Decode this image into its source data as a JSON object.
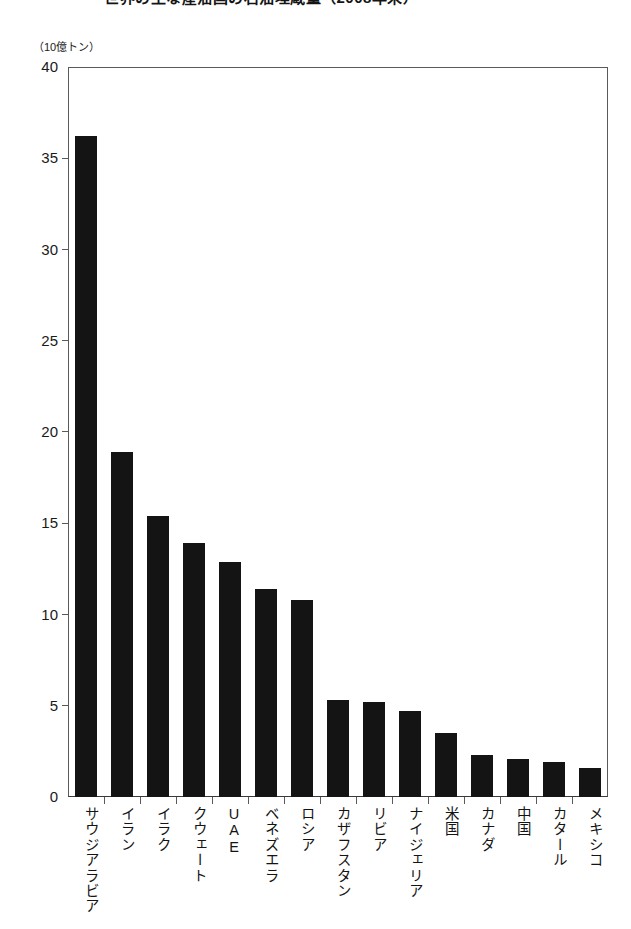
{
  "title": {
    "text": "世界の主な産油国の石油埋蔵量（2008年末）",
    "note": "cropped at top edge of screenshot"
  },
  "unit_caption": "（10億トン）",
  "axis": {
    "y_ticks": [
      "40",
      "35",
      "30",
      "25",
      "20",
      "15",
      "10",
      "5",
      "0"
    ],
    "y_tick_values": [
      40,
      35,
      30,
      25,
      20,
      15,
      10,
      5,
      0
    ]
  },
  "chart_data": {
    "type": "bar",
    "title": "世界の主な産油国の石油埋蔵量（2008年末）",
    "xlabel": "",
    "ylabel": "（10億トン）",
    "ylim": [
      0,
      40
    ],
    "ytick_step": 5,
    "grid": false,
    "legend": "none",
    "bar_color": "#141414",
    "categories": [
      "サウジアラビア",
      "イラン",
      "イラク",
      "クウェート",
      "UAE",
      "ベネズエラ",
      "ロシア",
      "カザフスタン",
      "リビア",
      "ナイジェリア",
      "米国",
      "カナダ",
      "中国",
      "カタール",
      "メキシコ"
    ],
    "values": [
      36.2,
      18.9,
      15.4,
      13.9,
      12.9,
      11.4,
      10.8,
      5.3,
      5.2,
      4.7,
      3.5,
      2.3,
      2.1,
      1.9,
      1.6
    ]
  }
}
